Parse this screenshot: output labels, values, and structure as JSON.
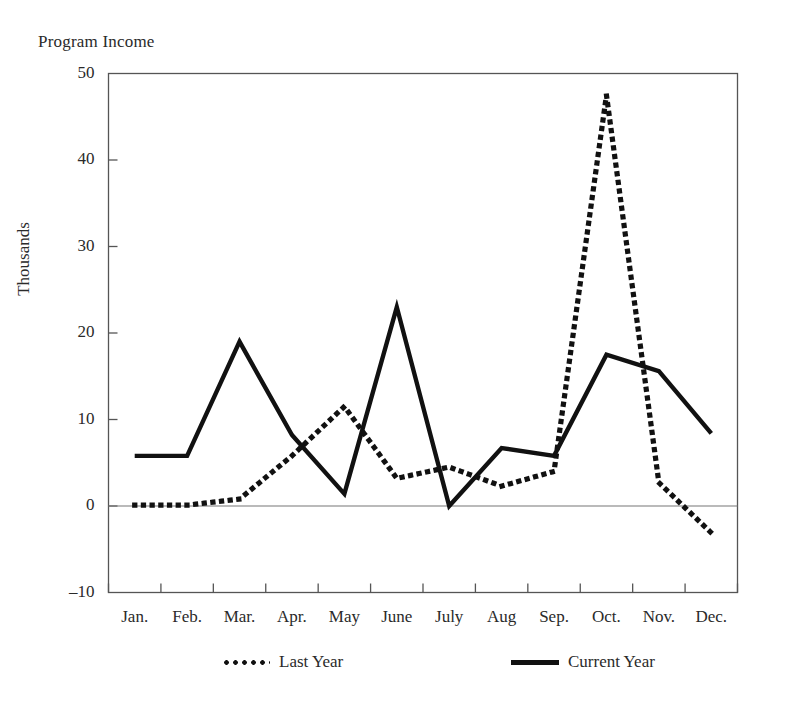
{
  "chart_data": {
    "type": "line",
    "title": "Program Income",
    "xlabel": "",
    "ylabel": "Thousands",
    "categories": [
      "Jan.",
      "Feb.",
      "Mar.",
      "Apr.",
      "May",
      "June",
      "July",
      "Aug",
      "Sep.",
      "Oct.",
      "Nov.",
      "Dec."
    ],
    "yticks": [
      -10,
      0,
      10,
      20,
      30,
      40,
      50
    ],
    "ytick_labels": [
      "–10",
      "0",
      "10",
      "20",
      "30",
      "40",
      "50"
    ],
    "ylim": [
      -10,
      50
    ],
    "grid": false,
    "legend_position": "bottom",
    "series": [
      {
        "name": "Last Year",
        "style": "dotted",
        "color": "#111111",
        "values": [
          0.1,
          0.1,
          0.8,
          5.8,
          11.5,
          3.2,
          4.5,
          2.3,
          4.0,
          47.5,
          2.7,
          -3.1
        ]
      },
      {
        "name": "Current Year",
        "style": "solid",
        "color": "#111111",
        "values": [
          5.8,
          5.8,
          19.0,
          8.2,
          1.4,
          23.0,
          0.0,
          6.7,
          5.8,
          17.5,
          15.6,
          8.4
        ]
      }
    ]
  },
  "legend": {
    "items": [
      {
        "label": "Last Year"
      },
      {
        "label": "Current Year"
      }
    ]
  },
  "axes": {
    "frame_color": "#555555",
    "zero_line_color": "#777777"
  }
}
